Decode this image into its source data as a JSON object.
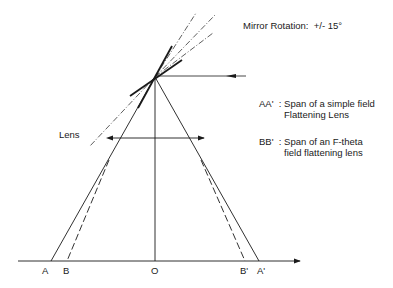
{
  "title": "Mirror Rotation:",
  "rotation_value": "+/- 15°",
  "lens_label": "Lens",
  "legend": [
    {
      "key": "AA'",
      "sep": ":",
      "line1": "Span of a simple field",
      "line2": "Flattening Lens"
    },
    {
      "key": "BB'",
      "sep": ":",
      "line1": "Span of an F-theta",
      "line2": "field flattening lens"
    }
  ],
  "axis_points": [
    "A",
    "B",
    "O",
    "B'",
    "A'"
  ],
  "colors": {
    "line": "#1a1a1a",
    "background": "#ffffff"
  }
}
